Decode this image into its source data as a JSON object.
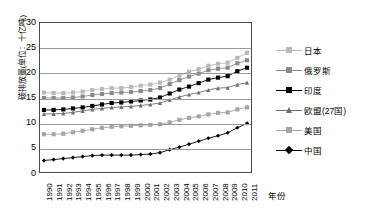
{
  "chart_data": {
    "type": "line",
    "title": "",
    "xlabel": "年份",
    "ylabel": "碳排放量(单位：十亿吨)",
    "ylim": [
      0,
      30
    ],
    "yticks": [
      0,
      5,
      10,
      15,
      20,
      25,
      30
    ],
    "grid": true,
    "legend_position": "right",
    "categories": [
      "1990",
      "1991",
      "1992",
      "1993",
      "1994",
      "1995",
      "1996",
      "1997",
      "1998",
      "1999",
      "2000",
      "2001",
      "2002",
      "2003",
      "2004",
      "2005",
      "2006",
      "2007",
      "2008",
      "2009",
      "2010",
      "2011"
    ],
    "series": [
      {
        "name": "日本",
        "marker": "square",
        "color": "#b9b9b9",
        "values": [
          16.0,
          15.9,
          15.9,
          16.0,
          16.2,
          16.5,
          16.7,
          16.9,
          16.9,
          17.1,
          17.4,
          17.6,
          18.0,
          18.6,
          19.4,
          20.2,
          20.7,
          21.4,
          21.8,
          22.0,
          23.0,
          24.0
        ]
      },
      {
        "name": "俄罗斯",
        "marker": "square",
        "color": "#8a8a8a",
        "values": [
          14.9,
          14.9,
          14.9,
          15.0,
          15.2,
          15.5,
          15.7,
          15.9,
          16.0,
          16.1,
          16.3,
          16.5,
          16.9,
          17.7,
          18.5,
          19.2,
          19.8,
          20.5,
          20.8,
          21.0,
          21.9,
          22.5
        ]
      },
      {
        "name": "印度",
        "marker": "square",
        "color": "#000000",
        "values": [
          12.5,
          12.5,
          12.6,
          12.8,
          13.0,
          13.3,
          13.6,
          13.9,
          14.0,
          14.2,
          14.4,
          14.6,
          15.0,
          15.8,
          16.6,
          17.2,
          17.9,
          18.6,
          19.0,
          19.3,
          20.3,
          21.0
        ]
      },
      {
        "name": "欧盟(27国)",
        "marker": "triangle",
        "color": "#6e6e6e",
        "values": [
          11.7,
          11.7,
          11.8,
          12.0,
          12.3,
          12.6,
          12.8,
          13.0,
          13.1,
          13.2,
          13.4,
          13.6,
          13.9,
          14.5,
          15.1,
          15.6,
          16.0,
          16.5,
          16.9,
          17.0,
          17.6,
          18.0
        ]
      },
      {
        "name": "美国",
        "marker": "square",
        "color": "#a5a5a5",
        "values": [
          7.6,
          7.6,
          7.7,
          8.0,
          8.3,
          8.6,
          8.9,
          9.1,
          9.2,
          9.3,
          9.4,
          9.5,
          9.6,
          10.0,
          10.5,
          10.9,
          11.2,
          11.6,
          11.9,
          12.0,
          12.6,
          13.0
        ]
      },
      {
        "name": "中国",
        "marker": "diamond",
        "color": "#000000",
        "values": [
          2.3,
          2.5,
          2.7,
          2.9,
          3.1,
          3.3,
          3.4,
          3.4,
          3.4,
          3.4,
          3.5,
          3.6,
          3.9,
          4.5,
          5.0,
          5.6,
          6.2,
          6.8,
          7.3,
          7.9,
          8.9,
          9.8
        ]
      }
    ]
  },
  "axes": {
    "y_title": "碳排放量(单位：十亿吨)",
    "x_title": "年份"
  }
}
